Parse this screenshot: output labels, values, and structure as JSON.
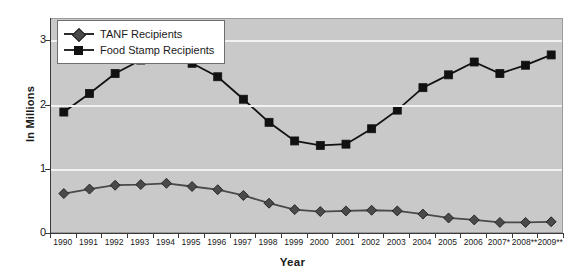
{
  "chart_data": {
    "type": "line",
    "title": "",
    "xlabel": "Year",
    "ylabel": "In Millions",
    "ylim": [
      0,
      3.35
    ],
    "yticks": [
      0,
      1,
      2,
      3
    ],
    "ytick_labels": [
      "0",
      "1",
      "2",
      "3"
    ],
    "grid": true,
    "legend_position": "top-left",
    "categories": [
      "1990",
      "1991",
      "1992",
      "1993",
      "1994",
      "1995",
      "1996",
      "1997",
      "1998",
      "1999",
      "2000",
      "2001",
      "2002",
      "2003",
      "2004",
      "2005",
      "2006",
      "2007*",
      "2008**",
      "2009**"
    ],
    "series": [
      {
        "name": "TANF Recipients",
        "marker": "diamond",
        "color": "#4a4a4a",
        "values": [
          0.63,
          0.7,
          0.76,
          0.77,
          0.79,
          0.74,
          0.69,
          0.6,
          0.48,
          0.38,
          0.35,
          0.36,
          0.37,
          0.36,
          0.31,
          0.25,
          0.22,
          0.18,
          0.18,
          0.19
        ]
      },
      {
        "name": "Food Stamp Recipients",
        "marker": "square",
        "color": "#111111",
        "values": [
          1.9,
          2.19,
          2.5,
          2.71,
          2.81,
          2.66,
          2.45,
          2.1,
          1.74,
          1.45,
          1.38,
          1.4,
          1.64,
          1.93,
          2.28,
          2.48,
          2.68,
          2.5,
          2.63,
          2.79
        ]
      }
    ],
    "footnotes": [
      "2007*",
      "2008**",
      "2009**"
    ]
  },
  "legend": {
    "items": [
      {
        "label": "TANF Recipients",
        "marker": "diamond-marker"
      },
      {
        "label": "Food Stamp Recipients",
        "marker": "square-marker"
      }
    ]
  },
  "colors": {
    "plot_background": "#c9c9c9",
    "gridline": "#f2f2f2",
    "axis": "#3a3a3a",
    "tanf_series": "#4a4a4a",
    "food_stamp_series": "#111111",
    "page_background": "#ffffff"
  }
}
